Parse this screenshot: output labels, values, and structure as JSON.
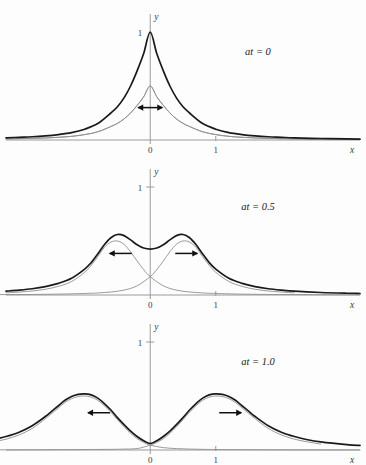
{
  "figure": {
    "title": "",
    "background_color": "#fdfdfd",
    "axis_color": "#9a9a9a",
    "sum_curve_color": "#1a1a1a",
    "component_curve_color": "#8f8f8f"
  },
  "chart_data": {
    "type": "line",
    "title": "",
    "xlabel": "x",
    "ylabel": "y",
    "grid": false,
    "legend": "none",
    "xlim": [
      -2.2,
      3.2
    ],
    "ylim": [
      -0.12,
      1.25
    ],
    "xticks": [
      0,
      1
    ],
    "xticklabels": [
      "0",
      "1"
    ],
    "yticks": [
      1
    ],
    "yticklabels": [
      "1"
    ],
    "panels": [
      {
        "label": "at = 0",
        "at": 0,
        "arrow": "double",
        "arrow_glyph": "↔",
        "ytick_labels": [
          "1"
        ],
        "ytick_shown": false,
        "series": [
          {
            "name": "sum",
            "role": "total",
            "color": "#1a1a1a",
            "peak_y": 1.0,
            "peak_x": 0.0,
            "x": [
              -2.2,
              -2.0,
              -1.8,
              -1.6,
              -1.4,
              -1.2,
              -1.0,
              -0.8,
              -0.6,
              -0.5,
              -0.4,
              -0.3,
              -0.2,
              -0.1,
              0.0,
              0.1,
              0.2,
              0.3,
              0.4,
              0.5,
              0.6,
              0.8,
              1.0,
              1.2,
              1.4,
              1.6,
              1.8,
              2.0,
              2.2,
              2.6,
              3.0,
              3.2
            ],
            "y": [
              0.02,
              0.025,
              0.03,
              0.038,
              0.05,
              0.068,
              0.1,
              0.152,
              0.25,
              0.308,
              0.39,
              0.5,
              0.64,
              0.8,
              1.0,
              0.8,
              0.64,
              0.5,
              0.39,
              0.308,
              0.25,
              0.152,
              0.1,
              0.068,
              0.05,
              0.038,
              0.03,
              0.025,
              0.02,
              0.014,
              0.01,
              0.009
            ]
          },
          {
            "name": "left-moving component",
            "role": "component",
            "color": "#8f8f8f",
            "peak_y": 0.5,
            "peak_x": 0.0,
            "x": [
              -2.2,
              -2.0,
              -1.8,
              -1.6,
              -1.4,
              -1.2,
              -1.0,
              -0.8,
              -0.6,
              -0.5,
              -0.4,
              -0.3,
              -0.2,
              -0.1,
              0.0,
              0.1,
              0.2,
              0.3,
              0.4,
              0.5,
              0.6,
              0.8,
              1.0,
              1.2,
              1.4,
              1.6,
              1.8,
              2.0,
              2.2,
              2.6,
              3.0,
              3.2
            ],
            "y": [
              0.01,
              0.0125,
              0.015,
              0.019,
              0.025,
              0.034,
              0.05,
              0.076,
              0.125,
              0.154,
              0.195,
              0.25,
              0.32,
              0.4,
              0.5,
              0.4,
              0.32,
              0.25,
              0.195,
              0.154,
              0.125,
              0.076,
              0.05,
              0.034,
              0.025,
              0.019,
              0.015,
              0.0125,
              0.01,
              0.007,
              0.005,
              0.0045
            ]
          },
          {
            "name": "right-moving component",
            "role": "component",
            "color": "#8f8f8f",
            "peak_y": 0.5,
            "peak_x": 0.0,
            "x": [
              -2.2,
              -2.0,
              -1.8,
              -1.6,
              -1.4,
              -1.2,
              -1.0,
              -0.8,
              -0.6,
              -0.5,
              -0.4,
              -0.3,
              -0.2,
              -0.1,
              0.0,
              0.1,
              0.2,
              0.3,
              0.4,
              0.5,
              0.6,
              0.8,
              1.0,
              1.2,
              1.4,
              1.6,
              1.8,
              2.0,
              2.2,
              2.6,
              3.0,
              3.2
            ],
            "y": [
              0.01,
              0.0125,
              0.015,
              0.019,
              0.025,
              0.034,
              0.05,
              0.076,
              0.125,
              0.154,
              0.195,
              0.25,
              0.32,
              0.4,
              0.5,
              0.4,
              0.32,
              0.25,
              0.195,
              0.154,
              0.125,
              0.076,
              0.05,
              0.034,
              0.025,
              0.019,
              0.015,
              0.0125,
              0.01,
              0.007,
              0.005,
              0.0045
            ]
          }
        ]
      },
      {
        "label": "at = 0.5",
        "at": 0.5,
        "arrow": "pair",
        "arrow_left_glyph": "←",
        "arrow_right_glyph": "→",
        "ytick_labels": [
          "1"
        ],
        "ytick_shown": true,
        "series": [
          {
            "name": "sum",
            "role": "total",
            "color": "#1a1a1a",
            "peak_y": 0.56,
            "peak_x_left": -0.5,
            "peak_x_right": 0.5,
            "center_dip_y": 0.42,
            "x": [
              -2.2,
              -2.0,
              -1.8,
              -1.6,
              -1.4,
              -1.2,
              -1.0,
              -0.9,
              -0.8,
              -0.7,
              -0.6,
              -0.5,
              -0.4,
              -0.3,
              -0.2,
              -0.1,
              0.0,
              0.1,
              0.2,
              0.3,
              0.4,
              0.5,
              0.6,
              0.7,
              0.8,
              0.9,
              1.0,
              1.2,
              1.4,
              1.6,
              1.8,
              2.0,
              2.2,
              2.6,
              3.0,
              3.2
            ],
            "y": [
              0.035,
              0.045,
              0.058,
              0.078,
              0.108,
              0.155,
              0.24,
              0.3,
              0.38,
              0.465,
              0.53,
              0.56,
              0.55,
              0.51,
              0.465,
              0.435,
              0.425,
              0.435,
              0.465,
              0.51,
              0.55,
              0.56,
              0.53,
              0.465,
              0.38,
              0.3,
              0.24,
              0.155,
              0.108,
              0.078,
              0.058,
              0.045,
              0.035,
              0.023,
              0.016,
              0.014
            ]
          },
          {
            "name": "left-moving component",
            "role": "component",
            "color": "#8f8f8f",
            "peak_y": 0.5,
            "peak_x": -0.5,
            "x": [
              -2.2,
              -2.0,
              -1.8,
              -1.6,
              -1.4,
              -1.2,
              -1.0,
              -0.9,
              -0.8,
              -0.7,
              -0.6,
              -0.5,
              -0.4,
              -0.3,
              -0.2,
              -0.1,
              0.0,
              0.2,
              0.4,
              0.6,
              0.8,
              1.0,
              1.4,
              1.8,
              2.2,
              2.6,
              3.0,
              3.2
            ],
            "y": [
              0.02,
              0.027,
              0.037,
              0.053,
              0.08,
              0.125,
              0.21,
              0.275,
              0.355,
              0.44,
              0.49,
              0.5,
              0.47,
              0.4,
              0.315,
              0.235,
              0.17,
              0.085,
              0.045,
              0.028,
              0.019,
              0.014,
              0.008,
              0.005,
              0.004,
              0.003,
              0.002,
              0.002
            ]
          },
          {
            "name": "right-moving component",
            "role": "component",
            "color": "#8f8f8f",
            "peak_y": 0.5,
            "peak_x": 0.5,
            "x": [
              -3.2,
              -3.0,
              -2.6,
              -2.2,
              -1.8,
              -1.4,
              -1.0,
              -0.8,
              -0.6,
              -0.4,
              -0.2,
              0.0,
              0.1,
              0.2,
              0.3,
              0.4,
              0.5,
              0.6,
              0.7,
              0.8,
              0.9,
              1.0,
              1.2,
              1.4,
              1.6,
              1.8,
              2.0,
              2.2
            ],
            "y": [
              0.002,
              0.002,
              0.003,
              0.004,
              0.005,
              0.008,
              0.014,
              0.019,
              0.028,
              0.045,
              0.085,
              0.17,
              0.235,
              0.315,
              0.4,
              0.47,
              0.5,
              0.49,
              0.44,
              0.355,
              0.275,
              0.21,
              0.125,
              0.08,
              0.053,
              0.037,
              0.027,
              0.02
            ]
          }
        ]
      },
      {
        "label": "at = 1.0",
        "at": 1.0,
        "arrow": "pair",
        "arrow_left_glyph": "←",
        "arrow_right_glyph": "→",
        "ytick_labels": [
          "1"
        ],
        "ytick_shown": true,
        "series": [
          {
            "name": "sum",
            "role": "total",
            "color": "#1a1a1a",
            "peak_y": 0.52,
            "peak_x_left": -1.0,
            "peak_x_right": 1.0,
            "center_dip_y": 0.055,
            "x": [
              -2.6,
              -2.4,
              -2.2,
              -2.0,
              -1.8,
              -1.6,
              -1.5,
              -1.4,
              -1.3,
              -1.2,
              -1.1,
              -1.0,
              -0.9,
              -0.8,
              -0.7,
              -0.6,
              -0.5,
              -0.4,
              -0.3,
              -0.2,
              -0.1,
              0.0,
              0.1,
              0.2,
              0.3,
              0.4,
              0.5,
              0.6,
              0.7,
              0.8,
              0.9,
              1.0,
              1.1,
              1.2,
              1.3,
              1.4,
              1.5,
              1.6,
              1.8,
              2.0,
              2.2,
              2.4,
              2.6,
              3.0,
              3.2
            ],
            "y": [
              0.075,
              0.095,
              0.125,
              0.165,
              0.225,
              0.31,
              0.36,
              0.41,
              0.46,
              0.495,
              0.515,
              0.52,
              0.51,
              0.48,
              0.43,
              0.37,
              0.3,
              0.235,
              0.175,
              0.125,
              0.085,
              0.06,
              0.085,
              0.125,
              0.175,
              0.235,
              0.3,
              0.37,
              0.43,
              0.48,
              0.51,
              0.52,
              0.515,
              0.495,
              0.46,
              0.41,
              0.36,
              0.31,
              0.225,
              0.165,
              0.125,
              0.095,
              0.075,
              0.05,
              0.042
            ]
          },
          {
            "name": "left-moving component",
            "role": "component",
            "color": "#8f8f8f",
            "peak_y": 0.5,
            "peak_x": -1.0,
            "x": [
              -2.6,
              -2.4,
              -2.2,
              -2.0,
              -1.8,
              -1.6,
              -1.5,
              -1.4,
              -1.3,
              -1.2,
              -1.1,
              -1.0,
              -0.9,
              -0.8,
              -0.7,
              -0.6,
              -0.5,
              -0.4,
              -0.3,
              -0.2,
              -0.1,
              0.0,
              0.2,
              0.4,
              0.6,
              0.8,
              1.0,
              1.4,
              1.8,
              2.2,
              2.6,
              3.0,
              3.2
            ],
            "y": [
              0.055,
              0.075,
              0.1,
              0.14,
              0.2,
              0.29,
              0.34,
              0.39,
              0.44,
              0.475,
              0.495,
              0.5,
              0.49,
              0.46,
              0.41,
              0.35,
              0.28,
              0.215,
              0.155,
              0.105,
              0.07,
              0.045,
              0.022,
              0.013,
              0.0085,
              0.006,
              0.0045,
              0.003,
              0.002,
              0.0015,
              0.001,
              0.001,
              0.001
            ]
          },
          {
            "name": "right-moving component",
            "role": "component",
            "color": "#8f8f8f",
            "peak_y": 0.5,
            "peak_x": 1.0,
            "x": [
              -3.2,
              -3.0,
              -2.6,
              -2.2,
              -1.8,
              -1.4,
              -1.0,
              -0.6,
              -0.4,
              -0.2,
              0.0,
              0.1,
              0.2,
              0.3,
              0.4,
              0.5,
              0.6,
              0.7,
              0.8,
              0.9,
              1.0,
              1.1,
              1.2,
              1.3,
              1.4,
              1.5,
              1.6,
              1.8,
              2.0,
              2.2,
              2.4,
              2.6
            ],
            "y": [
              0.001,
              0.001,
              0.001,
              0.0015,
              0.002,
              0.003,
              0.0045,
              0.006,
              0.0085,
              0.013,
              0.045,
              0.07,
              0.105,
              0.155,
              0.215,
              0.28,
              0.35,
              0.41,
              0.46,
              0.49,
              0.5,
              0.495,
              0.475,
              0.44,
              0.39,
              0.34,
              0.29,
              0.2,
              0.14,
              0.1,
              0.075,
              0.055
            ]
          }
        ]
      }
    ]
  }
}
